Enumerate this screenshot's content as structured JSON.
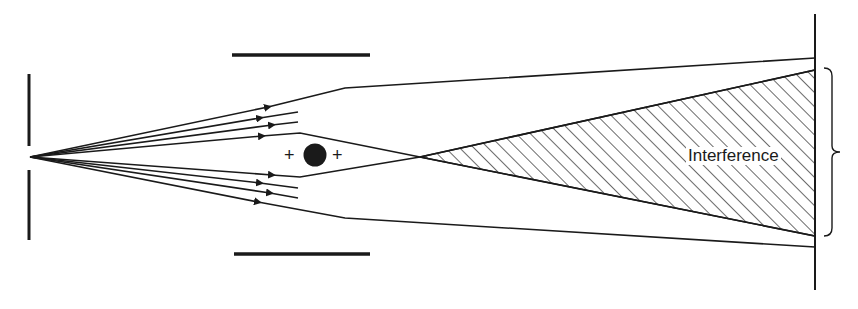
{
  "diagram": {
    "type": "electron-biprism / point-source interference schematic",
    "labels": {
      "interference": "Interference",
      "charge_left": "+",
      "charge_right": "+"
    },
    "elements": {
      "source_slit": {
        "x": 30,
        "gap_y": [
          146,
          170
        ],
        "point": [
          30,
          157
        ]
      },
      "top_baffle": {
        "x1": 232,
        "x2": 370,
        "y": 55
      },
      "bottom_baffle": {
        "x1": 234,
        "x2": 370,
        "y": 254
      },
      "obstacle": {
        "cx": 315,
        "cy": 155,
        "r": 11
      },
      "screen": {
        "x": 815,
        "y1": 14,
        "y2": 290
      },
      "crossing_point": [
        420,
        157
      ],
      "interference_region": {
        "apex": [
          420,
          157
        ],
        "top": [
          815,
          70
        ],
        "bottom": [
          815,
          236
        ]
      },
      "brace": {
        "x": 832,
        "y1": 68,
        "y2": 235
      }
    },
    "colors": {
      "ink": "#1a1a1a",
      "background": "#ffffff"
    }
  }
}
